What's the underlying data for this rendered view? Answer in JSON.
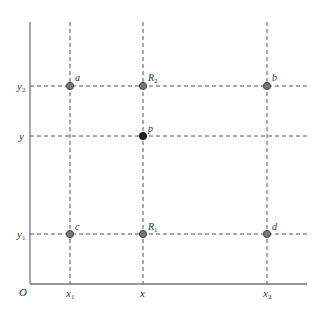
{
  "diagram": {
    "colors": {
      "axis": "#777777",
      "dashed": "#555555",
      "point_fill": "#777777",
      "point_stroke": "#444444",
      "p_fill": "#222222",
      "text": "#333333"
    },
    "origin_label": "O",
    "x_labels": [
      {
        "base": "x",
        "sub": "1"
      },
      {
        "base": "x",
        "sub": ""
      },
      {
        "base": "x",
        "sub": "2"
      }
    ],
    "y_labels": [
      {
        "base": "y",
        "sub": "2"
      },
      {
        "base": "y",
        "sub": ""
      },
      {
        "base": "y",
        "sub": "1"
      }
    ],
    "points": [
      {
        "name": "a",
        "sub": "",
        "type": "known"
      },
      {
        "name": "R",
        "sub": "2",
        "type": "interpolated"
      },
      {
        "name": "b",
        "sub": "",
        "type": "known"
      },
      {
        "name": "p",
        "sub": "",
        "type": "target"
      },
      {
        "name": "c",
        "sub": "",
        "type": "known"
      },
      {
        "name": "R",
        "sub": "1",
        "type": "interpolated"
      },
      {
        "name": "d",
        "sub": "",
        "type": "known"
      }
    ]
  }
}
